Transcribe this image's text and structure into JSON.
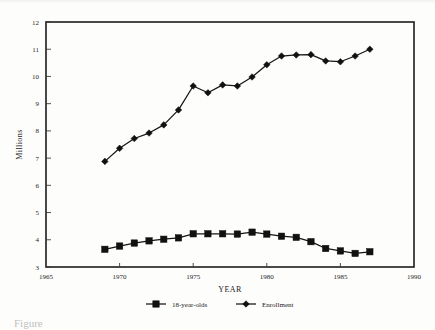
{
  "chart_data": {
    "type": "line",
    "title": "",
    "xlabel": "YEAR",
    "ylabel": "Millions",
    "xlim": [
      1965,
      1990
    ],
    "ylim": [
      3,
      12
    ],
    "xticks": [
      1965,
      1970,
      1975,
      1980,
      1985,
      1990
    ],
    "xtick_labels": [
      "1965",
      "1970",
      "1975",
      "1980",
      "1985",
      "1990"
    ],
    "yticks": [
      3,
      4,
      5,
      6,
      7,
      8,
      9,
      10,
      11,
      12
    ],
    "ytick_labels": [
      "3",
      "4",
      "5",
      "6",
      "7",
      "8",
      "9",
      "10",
      "11",
      "12"
    ],
    "grid": false,
    "legend_position": "below",
    "x": [
      1969,
      1970,
      1971,
      1972,
      1973,
      1974,
      1975,
      1976,
      1977,
      1978,
      1979,
      1980,
      1981,
      1982,
      1983,
      1984,
      1985,
      1986,
      1987
    ],
    "series": [
      {
        "name": "18-year-olds",
        "marker": "square",
        "values": [
          3.65,
          3.77,
          3.88,
          3.96,
          4.02,
          4.07,
          4.22,
          4.22,
          4.22,
          4.21,
          4.28,
          4.21,
          4.13,
          4.09,
          3.93,
          3.68,
          3.59,
          3.5,
          3.56
        ]
      },
      {
        "name": "Enrollment",
        "marker": "diamond",
        "values": [
          6.88,
          7.36,
          7.72,
          7.92,
          8.22,
          8.77,
          9.65,
          9.4,
          9.69,
          9.65,
          9.98,
          10.43,
          10.75,
          10.79,
          10.8,
          10.57,
          10.54,
          10.75,
          11.0
        ]
      }
    ]
  },
  "legend": {
    "items": [
      {
        "label": "18-year-olds",
        "marker": "square"
      },
      {
        "label": "Enrollment",
        "marker": "diamond"
      }
    ]
  },
  "caption": {
    "text": "Figure"
  },
  "colors": {
    "line": "#161616",
    "axis": "#1c1c1c",
    "background": "#fdfdfc"
  }
}
